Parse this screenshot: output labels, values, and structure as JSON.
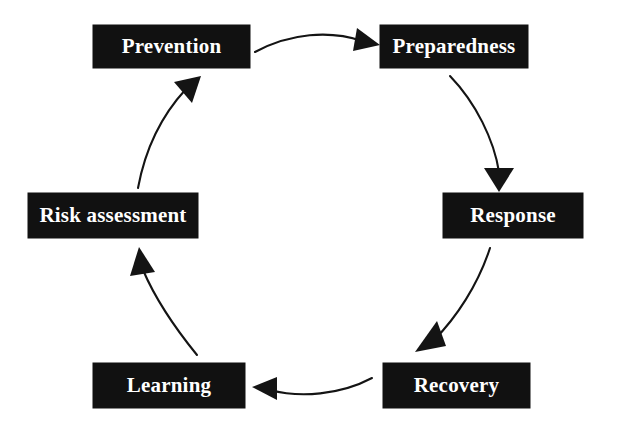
{
  "diagram": {
    "background_color": "#ffffff",
    "box_color": "#111111",
    "box_text_color": "#ffffff",
    "arrow_color": "#141414",
    "nodes": [
      {
        "id": "prevention",
        "label": "Prevention",
        "x": 93,
        "y": 25,
        "w": 157,
        "h": 43
      },
      {
        "id": "preparedness",
        "label": "Preparedness",
        "x": 380,
        "y": 25,
        "w": 148,
        "h": 43
      },
      {
        "id": "response",
        "label": "Response",
        "x": 443,
        "y": 193,
        "w": 140,
        "h": 45
      },
      {
        "id": "recovery",
        "label": "Recovery",
        "x": 383,
        "y": 363,
        "w": 147,
        "h": 45
      },
      {
        "id": "learning",
        "label": "Learning",
        "x": 93,
        "y": 363,
        "w": 152,
        "h": 45
      },
      {
        "id": "risk_assessment",
        "label": "Risk assessment",
        "x": 28,
        "y": 193,
        "w": 170,
        "h": 45
      }
    ],
    "arrows": [
      {
        "id": "prevention-to-preparedness",
        "from": "prevention",
        "to": "preparedness",
        "direction": "right"
      },
      {
        "id": "preparedness-to-response",
        "from": "preparedness",
        "to": "response",
        "direction": "down"
      },
      {
        "id": "response-to-recovery",
        "from": "response",
        "to": "recovery",
        "direction": "down-left"
      },
      {
        "id": "recovery-to-learning",
        "from": "recovery",
        "to": "learning",
        "direction": "left"
      },
      {
        "id": "learning-to-risk-assessment",
        "from": "learning",
        "to": "risk_assessment",
        "direction": "up"
      },
      {
        "id": "risk-assessment-to-prevention",
        "from": "risk_assessment",
        "to": "prevention",
        "direction": "up-right"
      }
    ]
  }
}
